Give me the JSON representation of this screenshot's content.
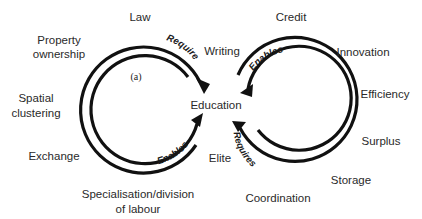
{
  "panel_label": "(a)",
  "center": "Education",
  "left_cycle": {
    "top_arrow_label": "Requires",
    "bottom_arrow_label": "Enables",
    "nodes": {
      "law": "Law",
      "property_1": "Property",
      "property_2": "ownership",
      "spatial_1": "Spatial",
      "spatial_2": "clustering",
      "exchange": "Exchange",
      "specialisation_1": "Specialisation/division",
      "specialisation_2": "of labour",
      "writing": "Writing",
      "elite": "Elite"
    }
  },
  "right_cycle": {
    "top_arrow_label": "Enables",
    "bottom_arrow_label": "Requires",
    "nodes": {
      "credit": "Credit",
      "innovation": "Innovation",
      "efficiency": "Efficiency",
      "surplus": "Surplus",
      "storage": "Storage",
      "coordination": "Coordination"
    }
  },
  "colors": {
    "arrow": "#111111",
    "text": "#2a2a2a",
    "background": "#ffffff"
  }
}
